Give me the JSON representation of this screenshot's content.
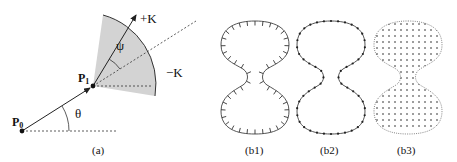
{
  "panel_a": {
    "caption": "(a)",
    "p0_label": "P",
    "p0_sub": "0",
    "p1_label": "P",
    "p1_sub": "1",
    "theta": "θ",
    "psi": "ψ",
    "plus_k": "+K",
    "minus_k": "−K",
    "sector_fill": "#d3d3d3"
  },
  "panel_b1": {
    "caption": "(b1)",
    "style": "contour-with-inward-ticks"
  },
  "panel_b2": {
    "caption": "(b2)",
    "style": "contour-with-dots"
  },
  "panel_b3": {
    "caption": "(b3)",
    "style": "dotted-contour-with-grid-fill"
  },
  "colors": {
    "line": "#333333",
    "dot": "#222222",
    "sector": "#d3d3d3"
  }
}
